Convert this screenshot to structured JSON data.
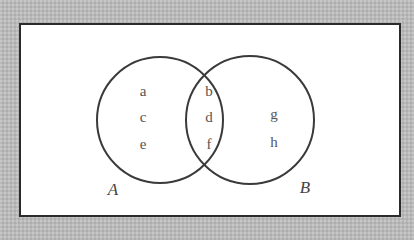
{
  "diagram": {
    "type": "venn",
    "sets": [
      {
        "name": "A",
        "only_elements": [
          "a",
          "c",
          "e"
        ]
      },
      {
        "name": "B",
        "only_elements": [
          "g",
          "h"
        ]
      }
    ],
    "intersection_elements": [
      "b",
      "d",
      "f"
    ],
    "colors": {
      "outline": "#3a3a3a",
      "background": "#b9b9b9",
      "panel": "#ffffff",
      "text": "#555555"
    }
  }
}
